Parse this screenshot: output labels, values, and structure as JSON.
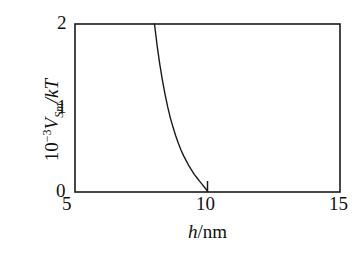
{
  "figure": {
    "background": "#ffffff",
    "ink": "#1a1a1a"
  },
  "axis": {
    "x_label_prefix": "h",
    "x_label_suffix": "/nm",
    "y_label_mantissa": "10",
    "y_label_exponent": "−3",
    "y_label_var": "V",
    "y_label_sub": "Sm",
    "y_label_tail": "/kT",
    "x_ticks": [
      "5",
      "10",
      "15"
    ],
    "y_ticks": [
      "0",
      "1",
      "2"
    ]
  },
  "chart_data": {
    "type": "line",
    "title": "",
    "xlabel": "h/nm",
    "ylabel": "10^-3 V_Sm/kT",
    "xlim": [
      5,
      15
    ],
    "ylim": [
      0,
      2
    ],
    "xticks": [
      5,
      10,
      15
    ],
    "yticks": [
      0,
      1,
      2
    ],
    "grid": false,
    "legend": null,
    "annotations": [
      {
        "text": "tick mark at curve foot",
        "x": 10,
        "y": 0
      }
    ],
    "series": [
      {
        "name": "V_Sm/kT",
        "color": "#1a1a1a",
        "linewidth": 1.4,
        "x": [
          8.0,
          8.1,
          8.2,
          8.3,
          8.4,
          8.5,
          8.6,
          8.7,
          8.8,
          8.9,
          9.0,
          9.1,
          9.2,
          9.3,
          9.4,
          9.5,
          9.6,
          9.7,
          9.8,
          9.9,
          10.0
        ],
        "y": [
          2.0,
          1.74,
          1.52,
          1.33,
          1.16,
          1.01,
          0.88,
          0.77,
          0.67,
          0.58,
          0.5,
          0.43,
          0.37,
          0.31,
          0.26,
          0.21,
          0.17,
          0.13,
          0.09,
          0.05,
          0.01
        ]
      }
    ]
  }
}
